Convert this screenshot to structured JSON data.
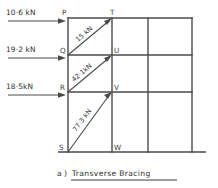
{
  "figure": {
    "caption_prefix": "a )",
    "caption_label": "Transverse   Bracing",
    "diagram_kind": "structural-frame-bracing"
  },
  "colors": {
    "line": "#4a4a4a",
    "text": "#2e2e2e",
    "background": "#ffffff"
  },
  "nodes": [
    {
      "id": "P",
      "label": "P",
      "x": 68,
      "y": 18,
      "label_x": 62,
      "label_y": 15
    },
    {
      "id": "T",
      "label": "T",
      "x": 112,
      "y": 18,
      "label_x": 110,
      "label_y": 15
    },
    {
      "id": "Q",
      "label": "Q",
      "x": 68,
      "y": 55,
      "label_x": 61,
      "label_y": 57
    },
    {
      "id": "U",
      "label": "U",
      "x": 112,
      "y": 55,
      "label_x": 113,
      "label_y": 53
    },
    {
      "id": "R",
      "label": "R",
      "x": 68,
      "y": 92,
      "label_x": 61,
      "label_y": 94
    },
    {
      "id": "V",
      "label": "V",
      "x": 112,
      "y": 92,
      "label_x": 113,
      "label_y": 90
    },
    {
      "id": "S",
      "label": "S",
      "x": 68,
      "y": 152,
      "label_x": 61,
      "label_y": 150
    },
    {
      "id": "W",
      "label": "W",
      "x": 112,
      "y": 152,
      "label_x": 113,
      "label_y": 150
    }
  ],
  "loads": [
    {
      "id": "load-P",
      "value": "10·6 kN",
      "applied_at": "P",
      "direction": "right",
      "text_x": 6,
      "text_y": 15,
      "line_x1": 8,
      "line_x2": 64,
      "line_y": 21
    },
    {
      "id": "load-Q",
      "value": "19·2 kN",
      "applied_at": "Q",
      "direction": "right",
      "text_x": 6,
      "text_y": 52,
      "line_x1": 8,
      "line_x2": 64,
      "line_y": 58
    },
    {
      "id": "load-R",
      "value": "18·5kN",
      "applied_at": "R",
      "direction": "right",
      "text_x": 6,
      "text_y": 89,
      "line_x1": 8,
      "line_x2": 64,
      "line_y": 95
    }
  ],
  "braces": [
    {
      "id": "brace-QT",
      "value": "15 kN",
      "from": "Q",
      "to": "T",
      "x1": 68,
      "y1": 55,
      "x2": 112,
      "y2": 18,
      "text_x": 78,
      "text_y": 42,
      "text_rotation": -40
    },
    {
      "id": "brace-RU",
      "value": "42·1kN",
      "from": "R",
      "to": "U",
      "x1": 68,
      "y1": 92,
      "x2": 112,
      "y2": 55,
      "text_x": 76,
      "text_y": 81,
      "text_rotation": -40
    },
    {
      "id": "brace-SV",
      "value": "77·3 kN",
      "from": "S",
      "to": "V",
      "x1": 68,
      "y1": 152,
      "x2": 112,
      "y2": 92,
      "text_x": 76,
      "text_y": 130,
      "text_rotation": -53
    }
  ],
  "frame": {
    "columns_x": [
      68,
      112,
      148,
      192
    ],
    "beams_y": [
      18,
      55,
      92
    ],
    "ground_y": 152,
    "ground_x1": 58,
    "ground_x2": 206
  }
}
